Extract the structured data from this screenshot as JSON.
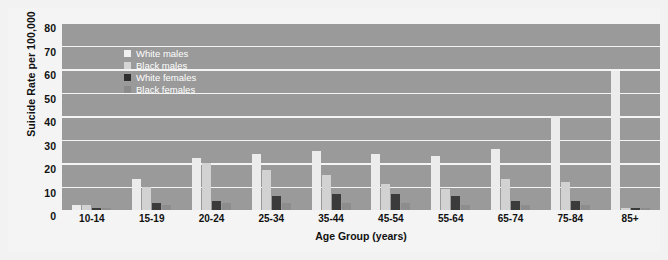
{
  "chart_data": {
    "type": "bar",
    "title": "",
    "xlabel": "Age Group (years)",
    "ylabel": "Suicide Rate per 100,000",
    "ylim": [
      0,
      80
    ],
    "yticks": [
      80,
      70,
      60,
      50,
      40,
      30,
      20,
      10,
      0
    ],
    "grid": true,
    "legend_position": "top-left-inside",
    "categories": [
      "10-14",
      "15-19",
      "20-24",
      "25-34",
      "35-44",
      "45-54",
      "55-64",
      "65-74",
      "75-84",
      "85+"
    ],
    "series": [
      {
        "name": "White males",
        "color": "#ececec",
        "values": [
          2,
          13,
          22,
          24,
          25,
          24,
          23,
          26,
          40,
          59
        ]
      },
      {
        "name": "Black males",
        "color": "#d2d2d2",
        "values": [
          2,
          10,
          20,
          17,
          15,
          11,
          9,
          13,
          12,
          1
        ]
      },
      {
        "name": "White females",
        "color": "#3b3b3b",
        "values": [
          1,
          3,
          4,
          6,
          7,
          7,
          6,
          4,
          4,
          1
        ]
      },
      {
        "name": "Black females",
        "color": "#8d8d8d",
        "values": [
          1,
          2,
          3,
          3,
          3,
          3,
          2,
          2,
          2,
          1
        ]
      }
    ]
  },
  "colors": {
    "plot_background": "#9a9a9a",
    "gridline": "#f4f4f4",
    "figure_background": "#f4f4f4",
    "page_background": "#f2f2f2",
    "text": "#111111",
    "legend_text": "#ffffff"
  }
}
